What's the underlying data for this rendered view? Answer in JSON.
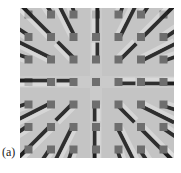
{
  "figure": {
    "panel_label": "(a)",
    "grid": {
      "rows": 7,
      "cols": 7
    },
    "colors": {
      "background": "#c4c4c4",
      "top_face": "#6e6e6e",
      "shadow": "#1e1e1e",
      "side": "#4a4a4a",
      "highlight": "#e2e2e2"
    }
  }
}
